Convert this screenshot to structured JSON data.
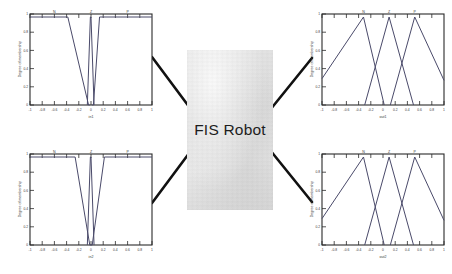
{
  "diagram": {
    "center_block": {
      "label": "FIS Robot",
      "fill_color": "#e3e3e3",
      "text_color": "#1d1d1d"
    },
    "connector_color": "#111111",
    "connectors": [
      {
        "name": "input1-to-fis",
        "from": "plot-input-1",
        "to": "fis-block"
      },
      {
        "name": "input2-to-fis",
        "from": "plot-input-2",
        "to": "fis-block"
      },
      {
        "name": "fis-to-output1",
        "from": "fis-block",
        "to": "plot-output-1"
      },
      {
        "name": "fis-to-output2",
        "from": "fis-block",
        "to": "plot-output-2"
      }
    ]
  },
  "plots": {
    "input_1": {
      "name": "plot-input-1",
      "axis_color": "#2a2a2a",
      "curve_color": "#4a4a6a",
      "ylabel": "Degree of membership",
      "xlabel": "in1",
      "xlim": [
        -1,
        1
      ],
      "ylim": [
        0,
        1
      ],
      "xticks": [
        "-1",
        "-0.8",
        "-0.6",
        "-0.4",
        "-0.2",
        "0",
        "0.2",
        "0.4",
        "0.6",
        "0.8",
        "1"
      ],
      "yticks": [
        "0",
        "0.2",
        "0.4",
        "0.6",
        "0.8",
        "1"
      ],
      "mf_labels": [
        {
          "text": "N",
          "x": -0.6
        },
        {
          "text": "Z",
          "x": 0.0
        },
        {
          "text": "P",
          "x": 0.6
        }
      ]
    },
    "input_2": {
      "name": "plot-input-2",
      "axis_color": "#2a2a2a",
      "curve_color": "#4a4a6a",
      "ylabel": "Degree of membership",
      "xlabel": "in2",
      "xlim": [
        -1,
        1
      ],
      "ylim": [
        0,
        1
      ],
      "xticks": [
        "-1",
        "-0.8",
        "-0.6",
        "-0.4",
        "-0.2",
        "0",
        "0.2",
        "0.4",
        "0.6",
        "0.8",
        "1"
      ],
      "yticks": [
        "0",
        "0.2",
        "0.4",
        "0.6",
        "0.8",
        "1"
      ],
      "mf_labels": [
        {
          "text": "N",
          "x": -0.6
        },
        {
          "text": "Z",
          "x": 0.0
        },
        {
          "text": "P",
          "x": 0.6
        }
      ]
    },
    "output_1": {
      "name": "plot-output-1",
      "axis_color": "#2a2a2a",
      "curve_color": "#4a4a6a",
      "ylabel": "Degree of membership",
      "xlabel": "out1",
      "xlim": [
        -1,
        1
      ],
      "ylim": [
        0,
        1
      ],
      "xticks": [
        "-1",
        "-0.8",
        "-0.6",
        "-0.4",
        "-0.2",
        "0",
        "0.2",
        "0.4",
        "0.6",
        "0.8",
        "1"
      ],
      "yticks": [
        "0",
        "0.2",
        "0.4",
        "0.6",
        "0.8",
        "1"
      ],
      "mf_labels": [
        {
          "text": "N",
          "x": -0.3
        },
        {
          "text": "Z",
          "x": 0.1
        },
        {
          "text": "P",
          "x": 0.5
        }
      ]
    },
    "output_2": {
      "name": "plot-output-2",
      "axis_color": "#2a2a2a",
      "curve_color": "#4a4a6a",
      "ylabel": "Degree of membership",
      "xlabel": "out2",
      "xlim": [
        -1,
        1
      ],
      "ylim": [
        0,
        1
      ],
      "xticks": [
        "-1",
        "-0.8",
        "-0.6",
        "-0.4",
        "-0.2",
        "0",
        "0.2",
        "0.4",
        "0.6",
        "0.8",
        "1"
      ],
      "yticks": [
        "0",
        "0.2",
        "0.4",
        "0.6",
        "0.8",
        "1"
      ],
      "mf_labels": [
        {
          "text": "N",
          "x": -0.3
        },
        {
          "text": "Z",
          "x": 0.1
        },
        {
          "text": "P",
          "x": 0.5
        }
      ]
    }
  },
  "chart_data": [
    {
      "type": "line",
      "name": "input_1",
      "title": "",
      "xlabel": "in1",
      "ylabel": "Degree of membership",
      "xlim": [
        -1,
        1
      ],
      "ylim": [
        0,
        1
      ],
      "grid": false,
      "legend": "none",
      "series": [
        {
          "name": "N",
          "x": [
            -1,
            -0.38,
            -0.04,
            -0.02
          ],
          "values": [
            1,
            1,
            0,
            0
          ]
        },
        {
          "name": "Z",
          "x": [
            -0.06,
            -0.01,
            0.0,
            0.05
          ],
          "values": [
            0,
            1,
            1,
            0
          ]
        },
        {
          "name": "P",
          "x": [
            0.02,
            0.04,
            0.14,
            1
          ],
          "values": [
            0,
            0,
            1,
            1
          ]
        }
      ]
    },
    {
      "type": "line",
      "name": "input_2",
      "title": "",
      "xlabel": "in2",
      "ylabel": "Degree of membership",
      "xlim": [
        -1,
        1
      ],
      "ylim": [
        0,
        1
      ],
      "grid": false,
      "legend": "none",
      "series": [
        {
          "name": "N",
          "x": [
            -1,
            -0.26,
            -0.02,
            0.0
          ],
          "values": [
            1,
            1,
            0,
            0
          ]
        },
        {
          "name": "Z",
          "x": [
            -0.06,
            -0.01,
            0.0,
            0.05
          ],
          "values": [
            0,
            1,
            1,
            0
          ]
        },
        {
          "name": "P",
          "x": [
            0.0,
            0.02,
            0.22,
            1
          ],
          "values": [
            0,
            0,
            1,
            1
          ]
        }
      ]
    },
    {
      "type": "line",
      "name": "output_1",
      "title": "",
      "xlabel": "out1",
      "ylabel": "Degree of membership",
      "xlim": [
        -1,
        1
      ],
      "ylim": [
        0,
        1
      ],
      "grid": false,
      "legend": "none",
      "series": [
        {
          "name": "N",
          "x": [
            -1,
            -0.32,
            0.02
          ],
          "values": [
            0.3,
            1,
            0
          ]
        },
        {
          "name": "Z",
          "x": [
            -0.3,
            0.1,
            0.5
          ],
          "values": [
            0,
            1,
            0
          ]
        },
        {
          "name": "P",
          "x": [
            0.12,
            0.52,
            1
          ],
          "values": [
            0,
            1,
            0.28
          ]
        }
      ]
    },
    {
      "type": "line",
      "name": "output_2",
      "title": "",
      "xlabel": "out2",
      "ylabel": "Degree of membership",
      "xlim": [
        -1,
        1
      ],
      "ylim": [
        0,
        1
      ],
      "grid": false,
      "legend": "none",
      "series": [
        {
          "name": "N",
          "x": [
            -1,
            -0.32,
            0.02
          ],
          "values": [
            0.3,
            1,
            0
          ]
        },
        {
          "name": "Z",
          "x": [
            -0.3,
            0.1,
            0.5
          ],
          "values": [
            0,
            1,
            0
          ]
        },
        {
          "name": "P",
          "x": [
            0.12,
            0.52,
            1
          ],
          "values": [
            0,
            1,
            0.28
          ]
        }
      ]
    }
  ]
}
